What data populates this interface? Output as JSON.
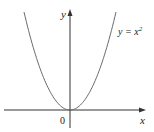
{
  "chart_data": {
    "type": "line",
    "title": "",
    "function": "y = x^2",
    "series": [
      {
        "name": "y = x^2",
        "x": [
          -2,
          -1.5,
          -1,
          -0.5,
          0,
          0.5,
          1,
          1.5,
          2
        ],
        "y": [
          4,
          2.25,
          1,
          0.25,
          0,
          0.25,
          1,
          2.25,
          4
        ]
      }
    ],
    "xlabel": "x",
    "ylabel": "y",
    "origin_label": "0",
    "curve_label": {
      "base": "y = x",
      "exponent": "2"
    },
    "grid": false,
    "legend": "none",
    "colors": {
      "curve": "#6b6b6b",
      "axes": "#333333"
    }
  }
}
